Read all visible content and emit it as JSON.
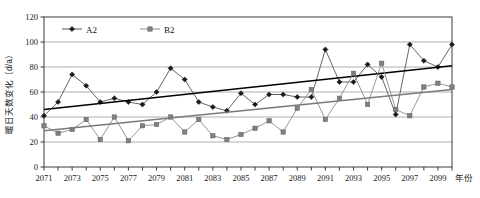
{
  "chart_data": {
    "type": "line",
    "title": "",
    "subtitle": "",
    "xlabel": "年份",
    "ylabel": "暖日天数变化（d/a）",
    "xlim": [
      2071,
      2100
    ],
    "ylim": [
      0,
      120
    ],
    "ytick_step": 20,
    "yticks": [
      0,
      20,
      40,
      60,
      80,
      100,
      120
    ],
    "ytick_labels": [
      "0",
      "20",
      "40",
      "60",
      "80",
      "100",
      "120"
    ],
    "x": [
      2071,
      2072,
      2073,
      2074,
      2075,
      2076,
      2077,
      2078,
      2079,
      2080,
      2081,
      2082,
      2083,
      2084,
      2085,
      2086,
      2087,
      2088,
      2089,
      2090,
      2091,
      2092,
      2093,
      2094,
      2095,
      2096,
      2097,
      2098,
      2099,
      2100
    ],
    "xticks": [
      2071,
      2072,
      2073,
      2074,
      2075,
      2076,
      2077,
      2078,
      2079,
      2080,
      2081,
      2082,
      2083,
      2084,
      2085,
      2086,
      2087,
      2088,
      2089,
      2090,
      2091,
      2092,
      2093,
      2094,
      2095,
      2096,
      2097,
      2098,
      2099,
      2100
    ],
    "xtick_labels": [
      "2071",
      "",
      "2073",
      "",
      "2075",
      "",
      "2077",
      "",
      "2079",
      "",
      "2081",
      "",
      "2083",
      "",
      "2085",
      "",
      "2087",
      "",
      "2089",
      "",
      "2091",
      "",
      "2093",
      "",
      "2095",
      "",
      "2097",
      "",
      "2099",
      ""
    ],
    "grid": true,
    "grid_axis": "y",
    "legend_position": "top-left",
    "series": [
      {
        "name": "A2",
        "marker": "diamond",
        "color": "#1a1a1a",
        "line_color": "#555555",
        "values": [
          41,
          52,
          74,
          65,
          52,
          55,
          52,
          50,
          60,
          79,
          70,
          52,
          48,
          45,
          59,
          50,
          58,
          58,
          56,
          56,
          94,
          68,
          68,
          82,
          72,
          42,
          98,
          85,
          80,
          98
        ],
        "trend": {
          "start_value": 46,
          "end_value": 81,
          "color": "#000000"
        }
      },
      {
        "name": "B2",
        "marker": "square",
        "color": "#808080",
        "line_color": "#8a8a8a",
        "values": [
          33,
          27,
          30,
          38,
          22,
          40,
          21,
          33,
          34,
          40,
          28,
          38,
          25,
          22,
          26,
          31,
          37,
          28,
          47,
          62,
          38,
          55,
          75,
          50,
          83,
          46,
          41,
          64,
          67,
          64
        ],
        "trend": {
          "start_value": 29,
          "end_value": 62,
          "color": "#7a7a7a"
        }
      }
    ]
  },
  "legend": {
    "entries": [
      {
        "label": "A2",
        "marker": "diamond-icon"
      },
      {
        "label": "B2",
        "marker": "square-icon"
      }
    ]
  },
  "axis": {
    "y_title": "暖日天数变化（d/a）",
    "x_title": "年份"
  }
}
